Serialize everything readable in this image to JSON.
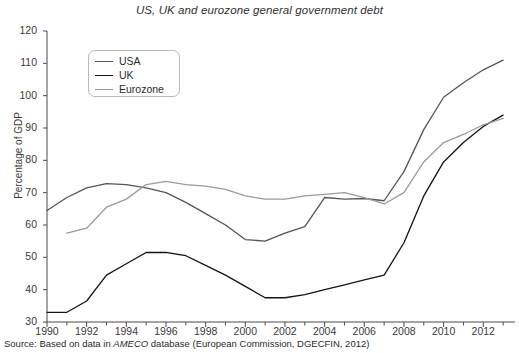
{
  "chart_data": {
    "type": "line",
    "title": "US, UK and eurozone general government debt",
    "xlabel": "",
    "ylabel": "Percentage of GDP",
    "xlim": [
      1990,
      2013.6
    ],
    "ylim": [
      30,
      120
    ],
    "ytick_step": 10,
    "xtick_step": 2,
    "grid": false,
    "legend_position": "top-left",
    "ytick_labels": [
      "30",
      "40",
      "50",
      "60",
      "70",
      "80",
      "90",
      "100",
      "110",
      "120"
    ],
    "xtick_labels": [
      "1990",
      "1992",
      "1994",
      "1996",
      "1998",
      "2000",
      "2002",
      "2004",
      "2006",
      "2008",
      "2010",
      "2012"
    ],
    "x": [
      1990,
      1991,
      1992,
      1993,
      1994,
      1995,
      1996,
      1997,
      1998,
      1999,
      2000,
      2001,
      2002,
      2003,
      2004,
      2005,
      2006,
      2007,
      2008,
      2009,
      2010,
      2011,
      2012,
      2013
    ],
    "series": [
      {
        "name": "USA",
        "color": "#555555",
        "x": [
          1990,
          1991,
          1992,
          1993,
          1994,
          1995,
          1996,
          1997,
          1998,
          1999,
          2000,
          2001,
          2002,
          2003,
          2004,
          2005,
          2006,
          2007,
          2008,
          2009,
          2010,
          2011,
          2012,
          2013
        ],
        "values": [
          64.5,
          68.5,
          71.5,
          72.8,
          72.5,
          71.5,
          70.0,
          67.0,
          63.5,
          60.0,
          55.5,
          55.0,
          57.5,
          59.5,
          68.5,
          68.0,
          68.2,
          67.5,
          76.5,
          89.5,
          99.5,
          104.0,
          108.0,
          111.0
        ]
      },
      {
        "name": "UK",
        "color": "#141414",
        "x": [
          1990,
          1991,
          1992,
          1993,
          1994,
          1995,
          1996,
          1997,
          1998,
          1999,
          2000,
          2001,
          2002,
          2003,
          2004,
          2005,
          2006,
          2007,
          2008,
          2009,
          2010,
          2011,
          2012,
          2013
        ],
        "values": [
          33.0,
          33.0,
          36.5,
          44.5,
          48.0,
          51.5,
          51.5,
          50.5,
          47.5,
          44.5,
          41.0,
          37.5,
          37.5,
          38.5,
          40.0,
          41.5,
          43.0,
          44.5,
          54.5,
          69.0,
          79.5,
          85.5,
          90.5,
          94.0
        ]
      },
      {
        "name": "Eurozone",
        "color": "#9a9a9a",
        "x": [
          1991,
          1992,
          1993,
          1994,
          1995,
          1996,
          1997,
          1998,
          1999,
          2000,
          2001,
          2002,
          2003,
          2004,
          2005,
          2006,
          2007,
          2008,
          2009,
          2010,
          2011,
          2012,
          2013
        ],
        "values": [
          57.5,
          59.0,
          65.5,
          68.0,
          72.5,
          73.5,
          72.5,
          72.0,
          71.0,
          69.0,
          68.0,
          68.0,
          69.0,
          69.5,
          70.0,
          68.5,
          66.5,
          70.0,
          79.5,
          85.5,
          88.0,
          91.0,
          93.0
        ]
      }
    ]
  },
  "legend": {
    "items": [
      {
        "label": "USA"
      },
      {
        "label": "UK"
      },
      {
        "label": "Eurozone"
      }
    ]
  },
  "source": {
    "prefix": "Source: Based on data in ",
    "emphasis": "AMECO",
    "suffix": " database (European Commission, DGECFIN, 2012)"
  }
}
